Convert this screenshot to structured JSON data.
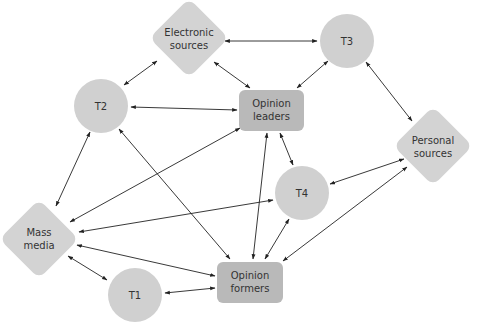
{
  "colors": {
    "circle_fill": "#d0d0d0",
    "diamond_fill": "#d3d3d3",
    "box_fill": "#b9b9b9",
    "edge": "#222222",
    "text": "#333333"
  },
  "nodes": {
    "electronic": {
      "label1": "Electronic",
      "label2": "sources",
      "shape": "diamond"
    },
    "t3": {
      "label1": "T3",
      "shape": "circle"
    },
    "t2": {
      "label1": "T2",
      "shape": "circle"
    },
    "leaders": {
      "label1": "Opinion",
      "label2": "leaders",
      "shape": "rounded-box"
    },
    "personal": {
      "label1": "Personal",
      "label2": "sources",
      "shape": "diamond"
    },
    "t4": {
      "label1": "T4",
      "shape": "circle"
    },
    "mass": {
      "label1": "Mass",
      "label2": "media",
      "shape": "diamond"
    },
    "formers": {
      "label1": "Opinion",
      "label2": "formers",
      "shape": "rounded-box"
    },
    "t1": {
      "label1": "T1",
      "shape": "circle"
    }
  },
  "edges": [
    [
      "Electronic sources",
      "T3"
    ],
    [
      "Electronic sources",
      "T2"
    ],
    [
      "Electronic sources",
      "Opinion leaders"
    ],
    [
      "T3",
      "Opinion leaders"
    ],
    [
      "T3",
      "Personal sources"
    ],
    [
      "T2",
      "Opinion leaders"
    ],
    [
      "T2",
      "Mass media"
    ],
    [
      "T2",
      "Opinion formers"
    ],
    [
      "Opinion leaders",
      "Mass media"
    ],
    [
      "Opinion leaders",
      "T4"
    ],
    [
      "Opinion leaders",
      "Opinion formers"
    ],
    [
      "T4",
      "Mass media"
    ],
    [
      "T4",
      "Personal sources"
    ],
    [
      "T4",
      "Opinion formers"
    ],
    [
      "Personal sources",
      "Opinion formers"
    ],
    [
      "Mass media",
      "Opinion formers"
    ],
    [
      "Mass media",
      "T1"
    ],
    [
      "T1",
      "Opinion formers"
    ]
  ]
}
